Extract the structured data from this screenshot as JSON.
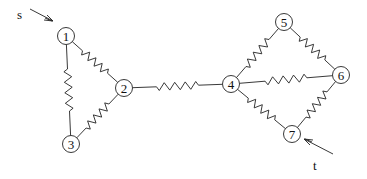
{
  "diagram": {
    "type": "resistor-network",
    "source_label": "s",
    "sink_label": "t",
    "nodes": [
      {
        "id": "1",
        "x": 66,
        "y": 36
      },
      {
        "id": "2",
        "x": 124,
        "y": 88
      },
      {
        "id": "3",
        "x": 71,
        "y": 144
      },
      {
        "id": "4",
        "x": 231,
        "y": 84
      },
      {
        "id": "5",
        "x": 284,
        "y": 22
      },
      {
        "id": "6",
        "x": 341,
        "y": 75
      },
      {
        "id": "7",
        "x": 292,
        "y": 134
      }
    ],
    "edges": [
      {
        "from": "1",
        "to": "2",
        "element": "resistor"
      },
      {
        "from": "1",
        "to": "3",
        "element": "resistor"
      },
      {
        "from": "2",
        "to": "3",
        "element": "resistor"
      },
      {
        "from": "2",
        "to": "4",
        "element": "resistor"
      },
      {
        "from": "4",
        "to": "5",
        "element": "resistor"
      },
      {
        "from": "4",
        "to": "6",
        "element": "resistor"
      },
      {
        "from": "4",
        "to": "7",
        "element": "resistor"
      },
      {
        "from": "5",
        "to": "6",
        "element": "resistor"
      },
      {
        "from": "6",
        "to": "7",
        "element": "resistor"
      }
    ],
    "source_arrow": {
      "points_to": "1"
    },
    "sink_arrow": {
      "points_to": "7"
    }
  }
}
